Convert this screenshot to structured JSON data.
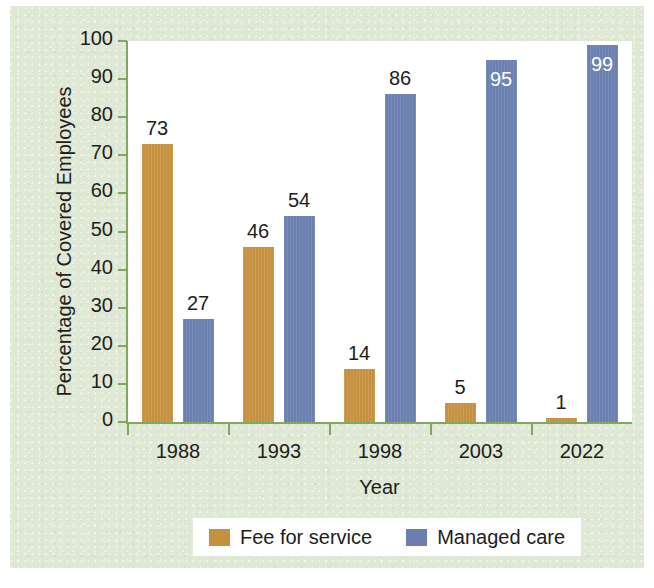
{
  "chart_data": {
    "type": "bar",
    "title": "",
    "xlabel": "Year",
    "ylabel": "Percentage of Covered Employees",
    "categories": [
      "1988",
      "1993",
      "1998",
      "2003",
      "2022"
    ],
    "ylim": [
      0,
      100
    ],
    "yticks": [
      0,
      10,
      20,
      30,
      40,
      50,
      60,
      70,
      80,
      90,
      100
    ],
    "ytick_labels": [
      "0",
      "10",
      "20",
      "30",
      "40",
      "50",
      "60",
      "70",
      "80",
      "90",
      "100"
    ],
    "grid": false,
    "legend_position": "bottom",
    "series": [
      {
        "name": "Fee for service",
        "color": "#c5913f",
        "values": [
          73,
          46,
          14,
          5,
          1
        ],
        "value_labels": [
          "73",
          "46",
          "14",
          "5",
          "1"
        ]
      },
      {
        "name": "Managed care",
        "color": "#6b80b0",
        "values": [
          27,
          54,
          86,
          95,
          99
        ],
        "value_labels": [
          "27",
          "54",
          "86",
          "95",
          "99"
        ]
      }
    ]
  },
  "colors": {
    "panel_background": "#dfe8d4",
    "plot_background": "#ffffff",
    "axis": "#7fa861",
    "text": "#1d1d1d",
    "fee_for_service": "#c5913f",
    "managed_care": "#6b80b0",
    "legend_background": "#ffffff"
  },
  "legend": {
    "items": [
      {
        "label": "Fee for service",
        "color": "#c5913f"
      },
      {
        "label": "Managed care",
        "color": "#6b80b0"
      }
    ]
  }
}
